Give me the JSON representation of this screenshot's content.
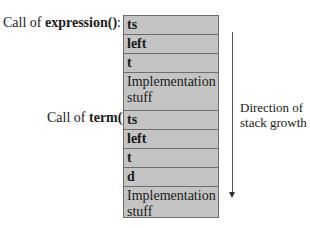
{
  "labels": {
    "expression_prefix": "Call of ",
    "expression_fn": "expression()",
    "expression_suffix": ":",
    "term_prefix": "Call of ",
    "term_fn": "term()",
    "term_suffix": ":"
  },
  "stack": [
    {
      "text": "ts",
      "bold": true
    },
    {
      "text": "left",
      "bold": true
    },
    {
      "text": "t",
      "bold": true
    },
    {
      "text": "Implementation stuff",
      "bold": false
    },
    {
      "text": "ts",
      "bold": true
    },
    {
      "text": "left",
      "bold": true
    },
    {
      "text": "t",
      "bold": true
    },
    {
      "text": "d",
      "bold": true
    },
    {
      "text": "Implementation stuff",
      "bold": false
    }
  ],
  "direction": {
    "line1": "Direction of",
    "line2": "stack growth"
  },
  "colors": {
    "cell_fill": "#c4c4c4",
    "cell_border": "#6e6e6e",
    "arrow": "#555555"
  }
}
